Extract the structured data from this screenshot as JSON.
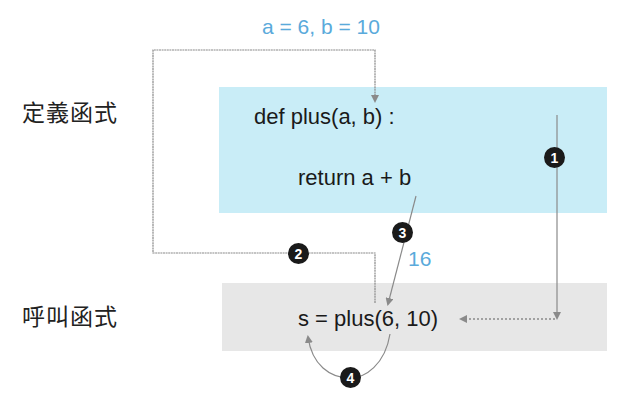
{
  "colors": {
    "definition_bg": "#c9edf7",
    "call_bg": "#e7e7e7",
    "annotation_blue": "#5aaadb",
    "arrow_gray": "#8a8a8a",
    "badge_black": "#1a1a1a"
  },
  "labels": {
    "definition": "定義函式",
    "call": "呼叫函式"
  },
  "annotations": {
    "args": "a = 6, b = 10",
    "result": "16"
  },
  "code": {
    "def_line": "def plus(a, b) :",
    "return_line": "return a + b",
    "call_line": "s = plus(6, 10)"
  },
  "steps": [
    {
      "number": "1",
      "description": "flow down from definition to call"
    },
    {
      "number": "2",
      "description": "arguments passed to function"
    },
    {
      "number": "3",
      "description": "return value 16"
    },
    {
      "number": "4",
      "description": "assign result to s"
    }
  ]
}
